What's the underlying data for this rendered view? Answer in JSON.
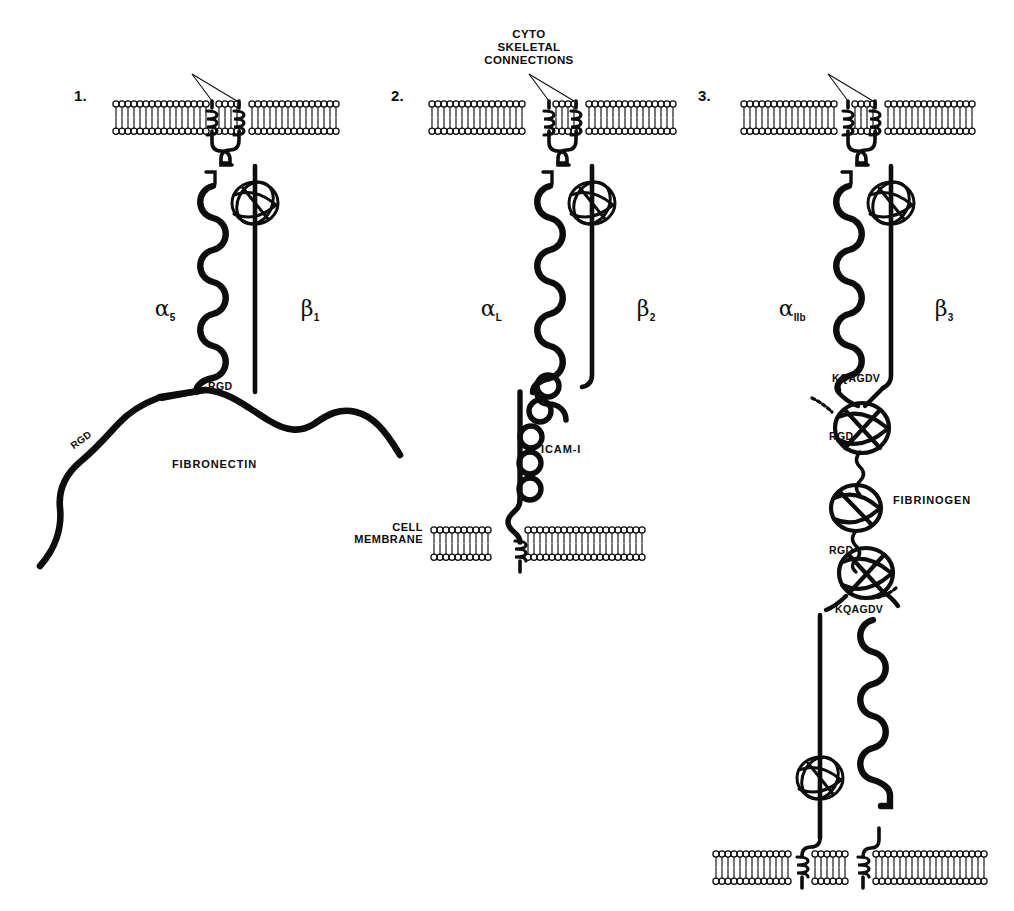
{
  "figure": {
    "background_color": "#ffffff",
    "ink_color": "#0d0d0d",
    "width": 1014,
    "height": 911
  },
  "shared_labels": {
    "cytoskeletal_connections": "CYTO\nSKELETAL\nCONNECTIONS",
    "cell_membrane": "CELL\nMEMBRANE"
  },
  "panels": [
    {
      "number": "1.",
      "alpha_label": "α",
      "alpha_sub": "5",
      "beta_label": "β",
      "beta_sub": "1",
      "ligand": "FIBRONECTIN",
      "binding_sites": [
        "RGD",
        "RGD"
      ],
      "description": "alpha5beta1 integrin bound to fibronectin via RGD motif"
    },
    {
      "number": "2.",
      "alpha_label": "α",
      "alpha_sub": "L",
      "beta_label": "β",
      "beta_sub": "2",
      "ligand": "ICAM-I",
      "binding_sites": [],
      "description": "alphaLbeta2 integrin bound to ICAM-I on an opposing cell membrane"
    },
    {
      "number": "3.",
      "alpha_label": "α",
      "alpha_sub": "IIb",
      "beta_label": "β",
      "beta_sub": "3",
      "ligand": "FIBRINOGEN",
      "binding_sites": [
        "KQAGDV",
        "RGD",
        "RGD",
        "KQAGDV"
      ],
      "description": "alphaIIbbeta3 integrin bridging two platelet membranes through fibrinogen"
    }
  ]
}
